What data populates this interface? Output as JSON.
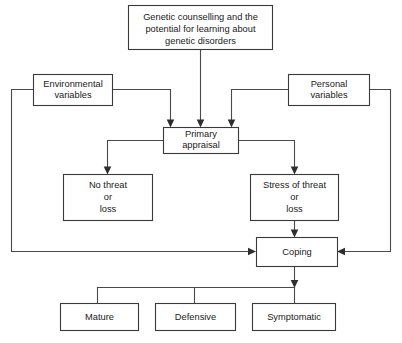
{
  "diagram": {
    "type": "flowchart",
    "colors": {
      "background": "#ffffff",
      "box_border": "#3a3a3a",
      "box_fill": "#ffffff",
      "line": "#4a4a4a",
      "text": "#1a1a1a"
    },
    "nodes": [
      {
        "id": "source",
        "lines": [
          "Genetic counselling and the",
          "potential for learning about",
          "genetic disorders"
        ]
      },
      {
        "id": "environmental",
        "lines": [
          "Environmental",
          "variables"
        ]
      },
      {
        "id": "personal",
        "lines": [
          "Personal",
          "variables"
        ]
      },
      {
        "id": "primary_appraisal",
        "lines": [
          "Primary",
          "appraisal"
        ]
      },
      {
        "id": "no_threat",
        "lines": [
          "No threat",
          "or",
          "loss"
        ]
      },
      {
        "id": "stress",
        "lines": [
          "Stress of threat",
          "or",
          "loss"
        ]
      },
      {
        "id": "coping",
        "lines": [
          "Coping"
        ]
      },
      {
        "id": "mature",
        "lines": [
          "Mature"
        ]
      },
      {
        "id": "defensive",
        "lines": [
          "Defensive"
        ]
      },
      {
        "id": "symptomatic",
        "lines": [
          "Symptomatic"
        ]
      }
    ]
  }
}
